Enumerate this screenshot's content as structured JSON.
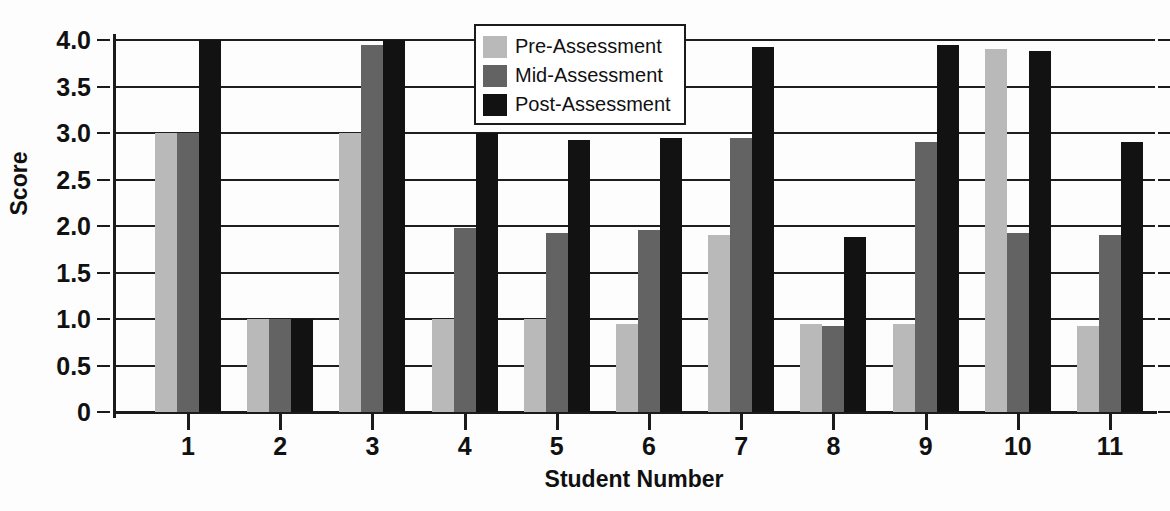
{
  "chart_data": {
    "type": "bar",
    "title": "",
    "xlabel": "Student Number",
    "ylabel": "Score",
    "categories": [
      "1",
      "2",
      "3",
      "4",
      "5",
      "6",
      "7",
      "8",
      "9",
      "10",
      "11"
    ],
    "ylim": [
      0,
      4.0
    ],
    "yticks": [
      "0",
      "0.5",
      "1.0",
      "1.5",
      "2.0",
      "2.5",
      "3.0",
      "3.5",
      "4.0"
    ],
    "ytick_values": [
      0,
      0.5,
      1.0,
      1.5,
      2.0,
      2.5,
      3.0,
      3.5,
      4.0
    ],
    "grid": true,
    "legend_position": "top-center",
    "series": [
      {
        "name": "Pre-Assessment",
        "color": "#b9b9b9",
        "values": [
          3.0,
          1.0,
          3.0,
          1.0,
          1.0,
          0.95,
          1.9,
          0.95,
          0.95,
          3.9,
          0.92
        ]
      },
      {
        "name": "Mid-Assessment",
        "color": "#636363",
        "values": [
          3.0,
          1.0,
          3.95,
          1.98,
          1.93,
          1.96,
          2.95,
          0.93,
          2.9,
          1.92,
          1.9
        ]
      },
      {
        "name": "Post-Assessment",
        "color": "#121212",
        "values": [
          4.0,
          1.0,
          4.0,
          3.0,
          2.93,
          2.95,
          3.92,
          1.88,
          3.95,
          3.88,
          2.9
        ]
      }
    ]
  }
}
